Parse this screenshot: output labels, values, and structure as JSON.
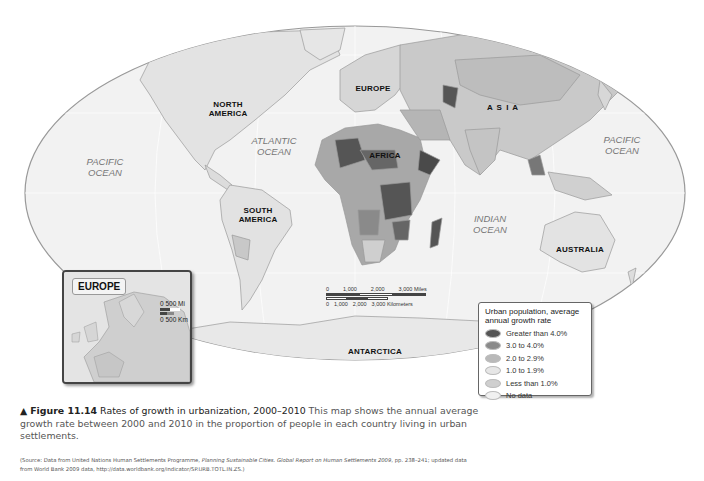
{
  "map": {
    "continents": [
      {
        "id": "north-america",
        "label": "NORTH\nAMERICA"
      },
      {
        "id": "south-america",
        "label": "SOUTH\nAMERICA"
      },
      {
        "id": "europe",
        "label": "EUROPE"
      },
      {
        "id": "asia",
        "label": "A S I A"
      },
      {
        "id": "africa",
        "label": "AFRICA"
      },
      {
        "id": "australia",
        "label": "AUSTRALIA"
      },
      {
        "id": "antarctica",
        "label": "ANTARCTICA"
      }
    ],
    "oceans": [
      {
        "id": "pacific-west",
        "line1": "PACIFIC",
        "line2": "OCEAN"
      },
      {
        "id": "atlantic",
        "line1": "ATLANTIC",
        "line2": "OCEAN"
      },
      {
        "id": "indian",
        "line1": "INDIAN",
        "line2": "OCEAN"
      },
      {
        "id": "pacific-east",
        "line1": "PACIFIC",
        "line2": "OCEAN"
      }
    ],
    "scale": {
      "miles_ticks": [
        "0",
        "1,000",
        "2,000",
        "3,000 Miles"
      ],
      "km_ticks": [
        "0",
        "1,000",
        "2,000",
        "3,000 Kilometers"
      ]
    }
  },
  "inset": {
    "title": "EUROPE",
    "scale_miles": "0      500 Mi",
    "scale_km": "0   500 Km"
  },
  "legend": {
    "title": "Urban population, average annual growth rate",
    "items": [
      {
        "label": "Greater than 4.0%",
        "color": "#555555"
      },
      {
        "label": "3.0 to 4.0%",
        "color": "#8a8a8a"
      },
      {
        "label": "2.0 to 2.9%",
        "color": "#b9b9b9"
      },
      {
        "label": "1.0 to 1.9%",
        "color": "#e6e6e6"
      },
      {
        "label": "Less than 1.0%",
        "color": "#cfcfcf"
      },
      {
        "label": "No data",
        "color": "#f0f0f0"
      }
    ]
  },
  "caption": {
    "marker": "▲",
    "figure": "Figure 11.14",
    "title": "Rates of growth in urbanization, 2000–2010",
    "text": "This map shows the annual average growth rate between 2000 and 2010 in the proportion of people in each country living in urban settlements."
  },
  "source": {
    "prefix": "(Source: Data from United Nations Human Settlements Programme, ",
    "italic1": "Planning Sustainable Cities. Global Report on Human Settlements 2009",
    "suffix": ", pp. 238–241; updated data from World Bank 2009 data, http://data.worldbank.org/indicator/SP.URB.TOTL.IN.ZS.)"
  }
}
